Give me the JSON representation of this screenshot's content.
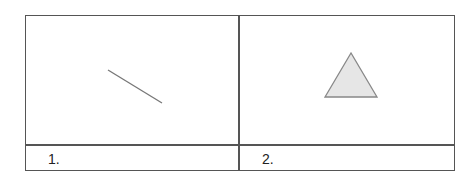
{
  "panels": [
    {
      "label": "1.",
      "figure": "line-segment",
      "stroke": "#777777"
    },
    {
      "label": "2.",
      "figure": "triangle",
      "stroke": "#888888",
      "fill": "#e6e6e6"
    }
  ]
}
